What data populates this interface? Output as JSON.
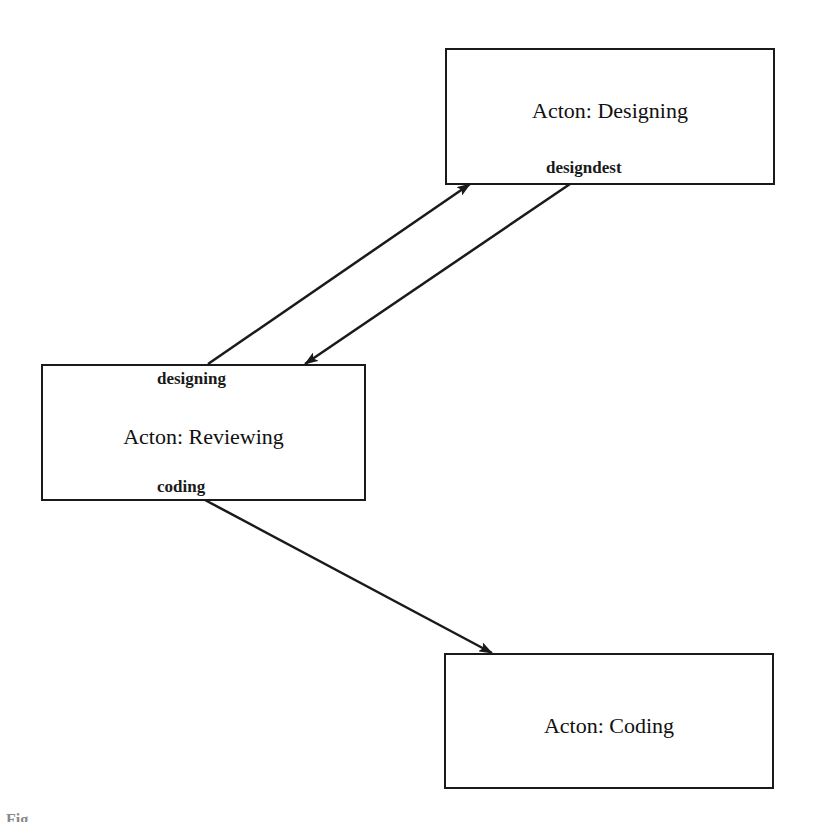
{
  "diagram": {
    "nodes": [
      {
        "id": "designing",
        "title": "Acton: Designing",
        "ports": [
          {
            "label": "designdest",
            "position": "bottom"
          }
        ]
      },
      {
        "id": "reviewing",
        "title": "Acton: Reviewing",
        "ports": [
          {
            "label": "designing",
            "position": "top"
          },
          {
            "label": "coding",
            "position": "bottom"
          }
        ]
      },
      {
        "id": "coding",
        "title": "Acton: Coding",
        "ports": []
      }
    ],
    "edges": [
      {
        "from": "reviewing.designing",
        "to": "designing",
        "arrow": "end"
      },
      {
        "from": "designing.designdest",
        "to": "reviewing",
        "arrow": "end"
      },
      {
        "from": "reviewing.coding",
        "to": "coding",
        "arrow": "end"
      }
    ],
    "colors": {
      "stroke": "#1a1a1a",
      "background": "#ffffff"
    }
  },
  "caption": "Fig."
}
